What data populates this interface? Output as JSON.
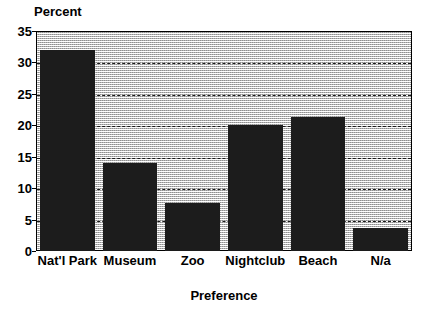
{
  "chart_data": {
    "type": "bar",
    "title": "",
    "categories": [
      "Nat'l Park",
      "Museum",
      "Zoo",
      "Nightclub",
      "Beach",
      "N/a"
    ],
    "values": [
      32,
      14,
      7.6,
      20,
      21.3,
      3.7
    ],
    "xlabel": "Preference",
    "ylabel": "Percent",
    "ylim": [
      0,
      35
    ],
    "yticks": [
      0,
      5,
      10,
      15,
      20,
      25,
      30,
      35
    ],
    "ytick_labels": [
      "0",
      "5",
      "10",
      "15",
      "20",
      "25",
      "30",
      "35"
    ],
    "grid": true,
    "grid_axis": "y",
    "grid_style": "dashed",
    "legend": "none",
    "bar_color": "#1c1c1c",
    "plot_background": "#e9e9e9",
    "frame_color": "#000000"
  }
}
